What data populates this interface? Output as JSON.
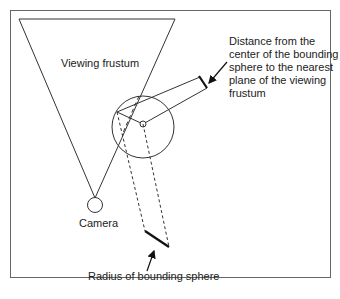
{
  "diagram": {
    "labels": {
      "frustum": "Viewing frustum",
      "camera": "Camera",
      "distance_lines": [
        "Distance from the",
        "center of the bounding",
        "sphere to the nearest",
        "plane of the viewing",
        "frustum"
      ],
      "radius": "Radius of bounding sphere"
    },
    "colors": {
      "line": "#333333",
      "frame": "#666666",
      "background": "#ffffff"
    }
  }
}
